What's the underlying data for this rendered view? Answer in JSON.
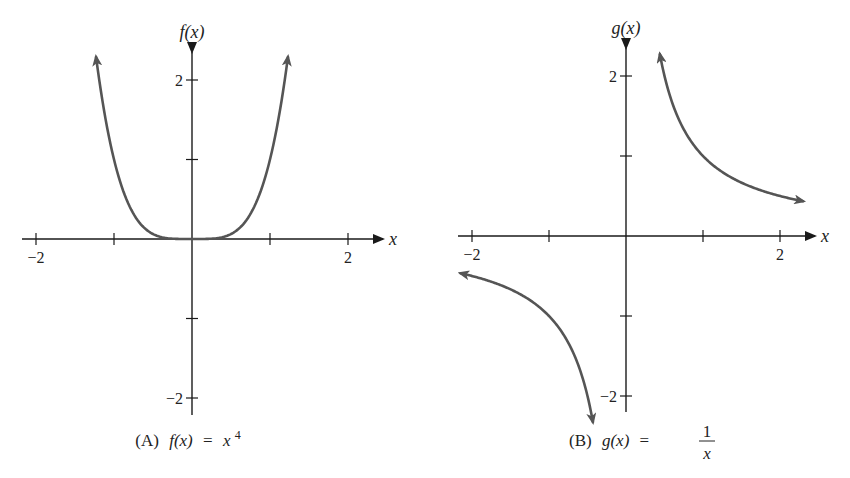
{
  "chart_data": [
    {
      "type": "line",
      "panel": "A",
      "caption": {
        "prefix": "(A)",
        "lhs": "f(x)",
        "equals": "=",
        "rhs_base": "x",
        "rhs_exponent": "4"
      },
      "function": "x^4",
      "xlabel": "x",
      "ylabel": "f(x)",
      "xlim": [
        -2.2,
        2.45
      ],
      "ylim": [
        -2.2,
        2.35
      ],
      "x_ticks": [
        -2,
        -1,
        1,
        2
      ],
      "x_tick_labels": [
        {
          "value": -2,
          "label": "−2"
        },
        {
          "value": 2,
          "label": "2"
        }
      ],
      "y_ticks": [
        -2,
        -1,
        1,
        2
      ],
      "y_tick_labels": [
        {
          "value": 2,
          "label": "2"
        },
        {
          "value": -2,
          "label": "−2"
        }
      ],
      "grid": false,
      "series": [
        {
          "name": "f(x) = x^4",
          "x_range": [
            -1.23,
            1.23
          ],
          "points": [
            [
              -1.23,
              2.29
            ],
            [
              -1.0,
              1.0
            ],
            [
              -0.75,
              0.316
            ],
            [
              -0.5,
              0.0625
            ],
            [
              -0.25,
              0.0039
            ],
            [
              0,
              0
            ],
            [
              0.25,
              0.0039
            ],
            [
              0.5,
              0.0625
            ],
            [
              0.75,
              0.316
            ],
            [
              1.0,
              1.0
            ],
            [
              1.23,
              2.29
            ]
          ],
          "arrows": "both ends",
          "color": "#555555"
        }
      ]
    },
    {
      "type": "line",
      "panel": "B",
      "caption": {
        "prefix": "(B)",
        "lhs": "g(x)",
        "equals": "=",
        "numerator": "1",
        "denominator": "x"
      },
      "function": "1/x",
      "xlabel": "x",
      "ylabel": "g(x)",
      "xlim": [
        -2.2,
        2.45
      ],
      "ylim": [
        -2.2,
        2.35
      ],
      "x_ticks": [
        -2,
        -1,
        1,
        2
      ],
      "x_tick_labels": [
        {
          "value": -2,
          "label": "−2"
        },
        {
          "value": 2,
          "label": "2"
        }
      ],
      "y_ticks": [
        -2,
        -1,
        1,
        2
      ],
      "y_tick_labels": [
        {
          "value": 2,
          "label": "2"
        },
        {
          "value": -2,
          "label": "−2"
        }
      ],
      "grid": false,
      "series": [
        {
          "name": "g(x) = 1/x, x > 0",
          "x_range": [
            0.44,
            2.3
          ],
          "points": [
            [
              0.44,
              2.27
            ],
            [
              0.5,
              2.0
            ],
            [
              0.75,
              1.333
            ],
            [
              1.0,
              1.0
            ],
            [
              1.5,
              0.667
            ],
            [
              2.0,
              0.5
            ],
            [
              2.3,
              0.435
            ]
          ],
          "arrows": "both ends",
          "color": "#555555"
        },
        {
          "name": "g(x) = 1/x, x < 0",
          "x_range": [
            -2.15,
            -0.43
          ],
          "points": [
            [
              -2.15,
              -0.465
            ],
            [
              -2.0,
              -0.5
            ],
            [
              -1.5,
              -0.667
            ],
            [
              -1.0,
              -1.0
            ],
            [
              -0.75,
              -1.333
            ],
            [
              -0.5,
              -2.0
            ],
            [
              -0.43,
              -2.33
            ]
          ],
          "arrows": "both ends",
          "color": "#555555"
        }
      ]
    }
  ],
  "panels": {
    "A": {
      "origin_px": [
        192,
        239
      ],
      "unit_px": [
        78,
        79.5
      ],
      "x_axis_px": [
        22,
        383
      ],
      "y_axis_px": [
        52,
        415
      ],
      "caption_px": [
        188,
        446
      ]
    },
    "B": {
      "origin_px": [
        626,
        236
      ],
      "unit_px": [
        77,
        80
      ],
      "x_axis_px": [
        458,
        815
      ],
      "y_axis_px": [
        48,
        412
      ],
      "caption_px": [
        637,
        446
      ]
    }
  }
}
